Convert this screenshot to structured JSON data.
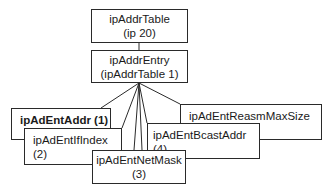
{
  "diagram": {
    "type": "MIB object tree",
    "colors": {
      "stroke": "#2a2a2a",
      "background": "#ffffff",
      "text": "#1a1a1a"
    },
    "root": {
      "line1": "ipAddrTable",
      "line2": "(ip 20)"
    },
    "entry": {
      "line1": "ipAddrEntry",
      "line2": "(ipAddrTable 1)"
    },
    "children": [
      {
        "id": "ipAdEntAddr",
        "label": "ipAdEntAddr (1)",
        "bold": true
      },
      {
        "id": "ipAdEntIfIndex",
        "label": "ipAdEntIfIndex (2)",
        "bold": false
      },
      {
        "id": "ipAdEntNetMask",
        "line1": "ipAdEntNetMask",
        "line2": "(3)",
        "bold": false
      },
      {
        "id": "ipAdEntBcastAddr",
        "label": "ipAdEntBcastAddr (4)",
        "bold": false
      },
      {
        "id": "ipAdEntReasmMaxSize",
        "label": "ipAdEntReasmMaxSize (5)",
        "bold": false
      }
    ]
  }
}
